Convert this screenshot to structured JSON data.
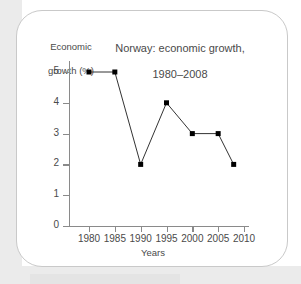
{
  "chart_data": {
    "type": "line",
    "title": "Norway: economic growth,\n1980–2008",
    "title_line1": "Norway: economic growth,",
    "title_line2": "1980–2008",
    "xlabel": "Years",
    "ylabel": "Economic\ngrowth (%)",
    "ylabel_line1": "Economic",
    "ylabel_line2": "growth (%)",
    "x": [
      1980,
      1985,
      1990,
      1995,
      2000,
      2005,
      2008
    ],
    "values": [
      5,
      5,
      2,
      4,
      3,
      3,
      2
    ],
    "series": [
      {
        "name": "Economic growth (%)",
        "values": [
          5,
          5,
          2,
          4,
          3,
          3,
          2
        ]
      }
    ],
    "xlim": [
      1977,
      2012
    ],
    "ylim": [
      0,
      5
    ],
    "xticks": [
      1980,
      1985,
      1990,
      1995,
      2000,
      2005,
      2010
    ],
    "xtick_labels": [
      "1980",
      "1985",
      "1990",
      "1995",
      "2000",
      "2005",
      "2010"
    ],
    "yticks": [
      0,
      1,
      2,
      3,
      4,
      5
    ],
    "ytick_labels": [
      "0",
      "1",
      "2",
      "3",
      "4",
      "5"
    ],
    "grid": false,
    "legend": false,
    "marker": "square",
    "line_color": "#333333",
    "marker_color": "#000000",
    "axis_color": "#8a8a8a",
    "text_color": "#4a4a4a"
  }
}
